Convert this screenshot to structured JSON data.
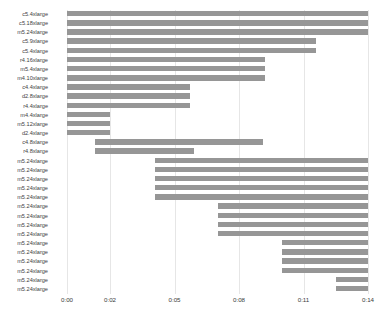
{
  "chart_data": {
    "type": "bar",
    "orientation": "horizontal",
    "subtype": "gantt",
    "title": "",
    "xlabel": "",
    "ylabel": "",
    "grid": true,
    "legend": false,
    "x_axis": {
      "tick_labels": [
        "0:00",
        "0:02",
        "0:05",
        "0:08",
        "0:11",
        "0:14"
      ],
      "tick_values": [
        0,
        2,
        5,
        8,
        11,
        14
      ],
      "xlim": [
        0,
        14
      ],
      "unit": "minutes"
    },
    "categories": [
      "c5.4xlarge",
      "c5.18xlarge",
      "m5.24xlarge",
      "c5.9xlarge",
      "c5.4xlarge",
      "r4.16xlarge",
      "m5.4xlarge",
      "m4.10xlarge",
      "c4.4xlarge",
      "d2.8xlarge",
      "r4.4xlarge",
      "m4.4xlarge",
      "m5.12xlarge",
      "d2.4xlarge",
      "c4.8xlarge",
      "r4.8xlarge",
      "m5.24xlarge",
      "m5.24xlarge",
      "m5.24xlarge",
      "m5.24xlarge",
      "m5.24xlarge",
      "m5.24xlarge",
      "m5.24xlarge",
      "m5.24xlarge",
      "m5.24xlarge",
      "m5.24xlarge",
      "m5.24xlarge",
      "m5.24xlarge",
      "m5.24xlarge",
      "m5.24xlarge",
      "m5.24xlarge"
    ],
    "starts": [
      0,
      0,
      0,
      0,
      0,
      0,
      0,
      0,
      0,
      0,
      0,
      0,
      0,
      0,
      1.3,
      1.3,
      4.1,
      4.1,
      4.1,
      4.1,
      4.1,
      7.0,
      7.0,
      7.0,
      7.0,
      10.0,
      10.0,
      10.0,
      10.0,
      12.5,
      12.5
    ],
    "ends": [
      14.0,
      14.0,
      14.0,
      11.6,
      11.6,
      9.2,
      9.2,
      9.2,
      5.7,
      5.7,
      5.7,
      2.0,
      2.0,
      2.0,
      9.1,
      5.9,
      14.0,
      14.0,
      14.0,
      14.0,
      14.0,
      14.0,
      14.0,
      14.0,
      14.0,
      14.0,
      14.0,
      14.0,
      14.0,
      14.0,
      14.0
    ],
    "durations": [
      14.0,
      14.0,
      14.0,
      11.6,
      11.6,
      9.2,
      9.2,
      9.2,
      5.7,
      5.7,
      5.7,
      2.0,
      2.0,
      2.0,
      7.8,
      4.6,
      9.9,
      9.9,
      9.9,
      9.9,
      9.9,
      7.0,
      7.0,
      7.0,
      7.0,
      4.0,
      4.0,
      4.0,
      4.0,
      1.5,
      1.5
    ],
    "bar_color": "#969696",
    "background_color": "#ffffff",
    "gridline_color": "#e6e6e6"
  }
}
